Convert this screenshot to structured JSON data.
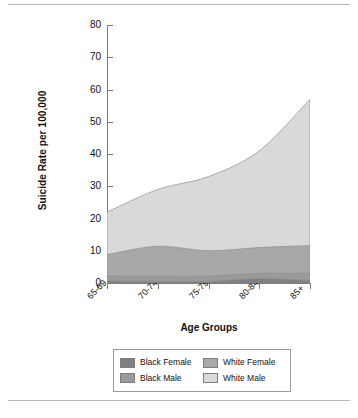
{
  "figure": {
    "clipped_header": "",
    "xlabel": "Age Groups",
    "ylabel": "Suicide Rate per 100,000"
  },
  "legend": {
    "items": [
      {
        "label": "Black Female",
        "color": "#808080"
      },
      {
        "label": "White Female",
        "color": "#a8a8a8"
      },
      {
        "label": "Black Male",
        "color": "#9a9a9a"
      },
      {
        "label": "White Male",
        "color": "#d9d9d9"
      }
    ]
  },
  "chart_data": {
    "type": "area",
    "stacked": true,
    "title": "",
    "xlabel": "Age Groups",
    "ylabel": "Suicide Rate per 100,000",
    "categories": [
      "65-69",
      "70-74",
      "75-79",
      "80-84",
      "85+"
    ],
    "ylim": [
      0,
      80
    ],
    "yticks": [
      0,
      10,
      20,
      30,
      40,
      50,
      60,
      70,
      80
    ],
    "grid": false,
    "legend_position": "bottom",
    "series": [
      {
        "name": "Black Female",
        "color": "#808080",
        "values": [
          0.6,
          0.5,
          0.5,
          1.4,
          0.8
        ]
      },
      {
        "name": "Black Male",
        "color": "#9a9a9a",
        "values": [
          1.6,
          1.6,
          1.6,
          1.6,
          2.2
        ]
      },
      {
        "name": "White Female",
        "color": "#a8a8a8",
        "values": [
          6.6,
          9.3,
          7.9,
          8.0,
          8.6
        ]
      },
      {
        "name": "White Male",
        "color": "#d9d9d9",
        "values": [
          13.2,
          17.6,
          23.0,
          30.0,
          45.4
        ]
      }
    ],
    "cumulative_tops": {
      "Black Female": [
        0.6,
        0.5,
        0.5,
        1.4,
        0.8
      ],
      "Black Male": [
        2.2,
        2.1,
        2.1,
        3.0,
        3.0
      ],
      "White Female": [
        8.8,
        11.4,
        10.0,
        11.0,
        11.6
      ],
      "White Male": [
        22.0,
        29.0,
        33.0,
        41.0,
        57.0
      ]
    },
    "totals": [
      22.0,
      29.0,
      33.0,
      41.0,
      57.0
    ]
  }
}
